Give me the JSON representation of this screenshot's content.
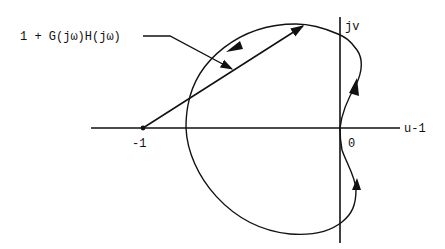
{
  "diagram": {
    "type": "nyquist-plot",
    "labels": {
      "vector_label": "1 + G(jω)H(jω)",
      "vertical_axis": "jv",
      "horizontal_axis": "u-1",
      "minus_one": "-1",
      "origin": "0"
    },
    "colors": {
      "ink": "#111111",
      "background": "#ffffff"
    }
  }
}
